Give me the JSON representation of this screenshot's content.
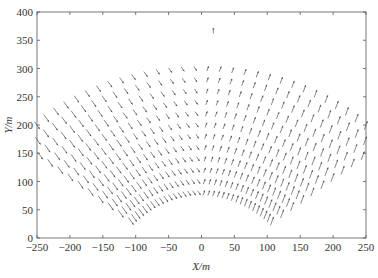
{
  "chart_data": {
    "type": "quiver",
    "title": "",
    "xlabel": "X/m",
    "ylabel": "Y/m",
    "xlim": [
      -250,
      250
    ],
    "ylim": [
      0,
      400
    ],
    "xticks": [
      -250,
      -200,
      -150,
      -100,
      -50,
      0,
      50,
      100,
      150,
      200,
      250
    ],
    "yticks": [
      0,
      50,
      100,
      150,
      200,
      250,
      300,
      350,
      400
    ],
    "grid": false,
    "legend": null,
    "field": {
      "description": "Fan-shaped sector grid of velocity vectors; left half vectors point down-right, right half vectors point up-right",
      "apex": [
        0,
        -60
      ],
      "radius_min": 140,
      "radius_max": 360,
      "n_arcs": 12,
      "angle_min_deg": 40,
      "angle_max_deg": 140,
      "n_rays": 34,
      "arrow_color": "#555555",
      "outlier_arrow": {
        "x": 18,
        "y": 362,
        "dx": 0,
        "dy": 10
      }
    }
  }
}
